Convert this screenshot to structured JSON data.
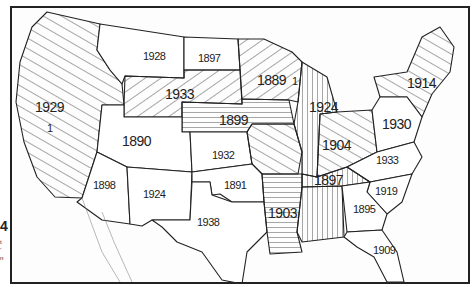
{
  "figure": {
    "number": "4",
    "caption_fragment": [
      "t",
      "’",
      "n"
    ]
  },
  "map": {
    "title": "Year of statewide adoption by region (United States)",
    "colors": {
      "line": "#222222",
      "background": "#fdfdfd",
      "coast": "#888888"
    },
    "regions": [
      {
        "name": "Pacific West (WA/OR/CA/NV/ID)",
        "label": "1929",
        "secondary_label": "1",
        "pattern": "diagonal-down"
      },
      {
        "name": "Montana",
        "label": "1928",
        "pattern": "none"
      },
      {
        "name": "North Dakota",
        "label": "1897",
        "pattern": "none"
      },
      {
        "name": "Wyoming / South Dakota",
        "label": "1933",
        "pattern": "diagonal-up"
      },
      {
        "name": "Minnesota / Wisconsin",
        "label": "1889",
        "secondary_label": "1",
        "pattern": "diagonal-up"
      },
      {
        "name": "Nebraska / Iowa",
        "label": "1899",
        "pattern": "horizontal"
      },
      {
        "name": "Colorado / Utah",
        "label": "1890",
        "pattern": "none"
      },
      {
        "name": "Kansas",
        "label": "1932",
        "pattern": "none"
      },
      {
        "name": "Michigan / Illinois",
        "label": "1924",
        "pattern": "vertical"
      },
      {
        "name": "Ohio / Indiana",
        "label": "1904",
        "pattern": "diagonal-down"
      },
      {
        "name": "Northeast",
        "label": "1914",
        "pattern": "diagonal-down"
      },
      {
        "name": "Pennsylvania / Mid-Atlantic",
        "label": "1930",
        "pattern": "none"
      },
      {
        "name": "Virginia / North Carolina",
        "label": "1933",
        "pattern": "none"
      },
      {
        "name": "Arizona",
        "label": "1898",
        "pattern": "none"
      },
      {
        "name": "New Mexico",
        "label": "1924",
        "pattern": "none"
      },
      {
        "name": "Oklahoma",
        "label": "1891",
        "pattern": "none"
      },
      {
        "name": "Texas",
        "label": "1938",
        "pattern": "none"
      },
      {
        "name": "Tennessee",
        "label": "1897",
        "pattern": "vertical"
      },
      {
        "name": "Arkansas / Louisiana",
        "label": "1903",
        "pattern": "horizontal"
      },
      {
        "name": "Alabama / Mississippi",
        "label": "",
        "pattern": "vertical"
      },
      {
        "name": "South Carolina",
        "label": "1919",
        "pattern": "none"
      },
      {
        "name": "Georgia",
        "label": "1895",
        "pattern": "none"
      },
      {
        "name": "Florida",
        "label": "1909",
        "pattern": "none"
      }
    ]
  }
}
